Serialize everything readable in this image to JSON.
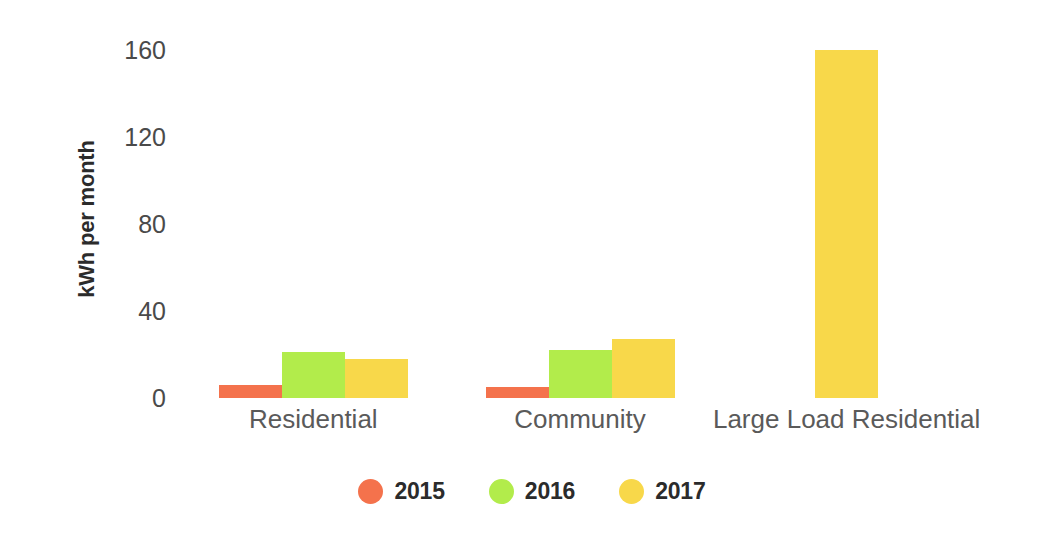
{
  "chart_data": {
    "type": "bar",
    "title": "",
    "subtitle": "",
    "xlabel": "",
    "ylabel": "kWh per month",
    "categories": [
      "Residential",
      "Community",
      "Large Load Residential"
    ],
    "series": [
      {
        "name": "2015",
        "color": "#F4724C",
        "values": [
          6,
          5,
          null
        ]
      },
      {
        "name": "2016",
        "color": "#B2EC4B",
        "values": [
          21,
          22,
          null
        ]
      },
      {
        "name": "2017",
        "color": "#F8D84A",
        "values": [
          18,
          27,
          160
        ]
      }
    ],
    "ylim": [
      0,
      160
    ],
    "yticks": [
      0,
      40,
      80,
      120,
      160
    ],
    "ytick_labels": [
      "0",
      "40",
      "80",
      "120",
      "160"
    ],
    "grid": false,
    "legend_position": "bottom",
    "annotations": []
  },
  "axis": {
    "y_title": "kWh per month",
    "ticks": [
      {
        "label": "160",
        "value": 160
      },
      {
        "label": "120",
        "value": 120
      },
      {
        "label": "80",
        "value": 80
      },
      {
        "label": "40",
        "value": 40
      },
      {
        "label": "0",
        "value": 0
      }
    ]
  },
  "categories": [
    {
      "label": "Residential"
    },
    {
      "label": "Community"
    },
    {
      "label": "Large Load Residential"
    }
  ],
  "legend": {
    "items": [
      {
        "label": "2015",
        "color": "#F4724C",
        "icon": "circle-swatch-icon"
      },
      {
        "label": "2016",
        "color": "#B2EC4B",
        "icon": "circle-swatch-icon"
      },
      {
        "label": "2017",
        "color": "#F8D84A",
        "icon": "circle-swatch-icon"
      }
    ]
  },
  "colors": {
    "series_2015": "#F4724C",
    "series_2016": "#B2EC4B",
    "series_2017": "#F8D84A",
    "text": "#3b3b3b",
    "background": "#ffffff"
  }
}
